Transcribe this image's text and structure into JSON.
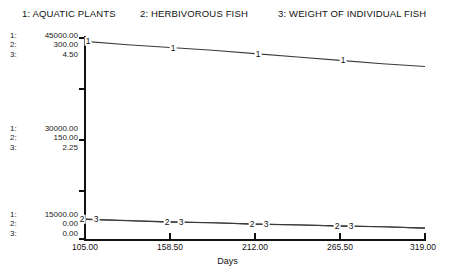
{
  "legend": {
    "items": [
      {
        "key": "1",
        "label": "1: AQUATIC PLANTS"
      },
      {
        "key": "2",
        "label": "2: HERBIVOROUS  FISH"
      },
      {
        "key": "3",
        "label": "3: WEIGHT OF INDIVIDUAL FISH"
      }
    ]
  },
  "scales": {
    "top": {
      "i1": "1:",
      "v1": "45000.00",
      "i2": "2:",
      "v2": "300.00",
      "i3": "3:",
      "v3": "4.50"
    },
    "middle": {
      "i1": "1:",
      "v1": "30000.00",
      "i2": "2:",
      "v2": "150.00",
      "i3": "3:",
      "v3": "2.25"
    },
    "bottom": {
      "i1": "1:",
      "v1": "15000.00",
      "i2": "2:",
      "v2": "0.00",
      "i3": "3:",
      "v3": "0.00"
    }
  },
  "xaxis": {
    "title": "Days",
    "ticks": [
      "105.00",
      "158.50",
      "212.00",
      "265.50",
      "319.00"
    ]
  },
  "markers": {
    "s1": [
      "1",
      "1",
      "1",
      "1"
    ],
    "s2": [
      "2",
      "2",
      "2",
      "2"
    ],
    "s3": [
      "3",
      "3",
      "3",
      "3"
    ]
  },
  "chart_data": {
    "type": "line",
    "title": "",
    "subtitle": "",
    "xlabel": "Days",
    "ylabel": "",
    "grid": false,
    "legend_position": "top",
    "xlim": [
      105.0,
      319.0
    ],
    "xticks": [
      105.0,
      158.5,
      212.0,
      265.5,
      319.0
    ],
    "axes_note": "Three independent y-scales sharing one plot frame; scale labels shown at 3 levels (top, middle, bottom).",
    "yscales": [
      {
        "series": "1: AQUATIC PLANTS",
        "min": 15000.0,
        "mid": 30000.0,
        "max": 45000.0,
        "ticklabels": [
          "15000.00",
          "30000.00",
          "45000.00"
        ]
      },
      {
        "series": "2: HERBIVOROUS  FISH",
        "min": 0.0,
        "mid": 150.0,
        "max": 300.0,
        "ticklabels": [
          "0.00",
          "150.00",
          "300.00"
        ]
      },
      {
        "series": "3: WEIGHT OF INDIVIDUAL FISH",
        "min": 0.0,
        "mid": 2.25,
        "max": 4.5,
        "ticklabels": [
          "0.00",
          "2.25",
          "4.50"
        ]
      }
    ],
    "x": [
      105.0,
      131.75,
      158.5,
      185.25,
      212.0,
      238.75,
      265.5,
      292.25,
      319.0
    ],
    "series": [
      {
        "name": "1: AQUATIC PLANTS",
        "marker": "1",
        "scale_index": 0,
        "values": [
          44200,
          43700,
          43300,
          42900,
          42400,
          41900,
          41400,
          40900,
          40500
        ]
      },
      {
        "name": "2: HERBIVOROUS  FISH",
        "marker": "2",
        "scale_index": 1,
        "values": [
          29,
          27,
          25,
          24,
          22,
          21,
          19,
          18,
          16
        ]
      },
      {
        "name": "3: WEIGHT OF INDIVIDUAL FISH",
        "marker": "3",
        "scale_index": 2,
        "values": [
          0.44,
          0.41,
          0.38,
          0.36,
          0.33,
          0.31,
          0.29,
          0.27,
          0.24
        ]
      }
    ]
  }
}
